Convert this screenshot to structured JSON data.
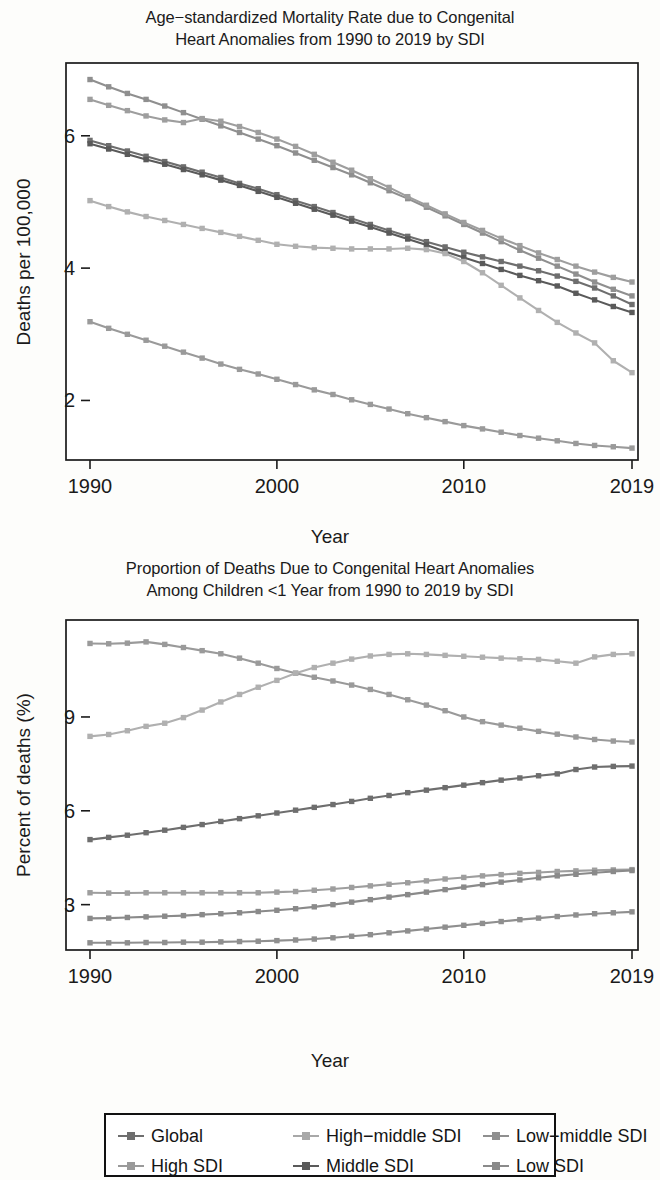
{
  "figure": {
    "xlabel": "Year",
    "x_ticks": [
      "1990",
      "2000",
      "2010",
      "2019"
    ]
  },
  "panel_top": {
    "title_line1": "Age−standardized Mortality Rate due to Congenital",
    "title_line2": "Heart Anomalies from 1990 to 2019 by SDI",
    "ylabel": "Deaths per 100,000",
    "y_ticks": [
      "2",
      "4",
      "6"
    ],
    "xlabel": "Year"
  },
  "panel_bottom": {
    "title_line1": "Proportion of Deaths Due to Congenital Heart Anomalies",
    "title_line2": "Among Children <1 Year from 1990 to 2019 by SDI",
    "ylabel": "Percent of deaths (%)",
    "y_ticks": [
      "3",
      "6",
      "9"
    ],
    "xlabel": "Year"
  },
  "legend": {
    "items": [
      {
        "label": "Global",
        "color": "#6e6e6e"
      },
      {
        "label": "High−middle SDI",
        "color": "#a8a8a8"
      },
      {
        "label": "Low−middle SDI",
        "color": "#8f8f8f"
      },
      {
        "label": "High SDI",
        "color": "#9a9a9a"
      },
      {
        "label": "Middle SDI",
        "color": "#5a5a5a"
      },
      {
        "label": "Low SDI",
        "color": "#8a8a8a"
      }
    ]
  },
  "chart_data": [
    {
      "type": "line",
      "title": "Age−standardized Mortality Rate due to Congenital Heart Anomalies from 1990 to 2019 by SDI",
      "xlabel": "Year",
      "ylabel": "Deaths per 100,000",
      "xlim": [
        1990,
        2019
      ],
      "ylim": [
        1.1,
        7.1
      ],
      "yticks": [
        2,
        4,
        6
      ],
      "xticks": [
        1990,
        2000,
        2010,
        2019
      ],
      "grid": false,
      "legend_position": "bottom-shared",
      "x": [
        1990,
        1991,
        1992,
        1993,
        1994,
        1995,
        1996,
        1997,
        1998,
        1999,
        2000,
        2001,
        2002,
        2003,
        2004,
        2005,
        2006,
        2007,
        2008,
        2009,
        2010,
        2011,
        2012,
        2013,
        2014,
        2015,
        2016,
        2017,
        2018,
        2019
      ],
      "series": [
        {
          "name": "Low SDI",
          "color": "#8f8f8f",
          "values": [
            6.85,
            6.74,
            6.64,
            6.55,
            6.45,
            6.35,
            6.25,
            6.15,
            6.05,
            5.95,
            5.85,
            5.74,
            5.63,
            5.52,
            5.41,
            5.29,
            5.17,
            5.05,
            4.92,
            4.79,
            4.66,
            4.53,
            4.4,
            4.27,
            4.15,
            4.03,
            3.91,
            3.79,
            3.68,
            3.58
          ],
          "endpoint_label": "3.58"
        },
        {
          "name": "Low−middle SDI",
          "color": "#9e9e9e",
          "values": [
            6.55,
            6.46,
            6.38,
            6.3,
            6.24,
            6.2,
            6.26,
            6.22,
            6.14,
            6.05,
            5.95,
            5.84,
            5.72,
            5.6,
            5.48,
            5.35,
            5.22,
            5.08,
            4.95,
            4.82,
            4.69,
            4.57,
            4.45,
            4.34,
            4.23,
            4.13,
            4.03,
            3.94,
            3.86,
            3.79
          ],
          "endpoint_label": "3.79"
        },
        {
          "name": "Global",
          "color": "#6e6e6e",
          "values": [
            5.93,
            5.85,
            5.77,
            5.69,
            5.61,
            5.53,
            5.45,
            5.37,
            5.28,
            5.2,
            5.11,
            5.02,
            4.93,
            4.84,
            4.75,
            4.66,
            4.57,
            4.48,
            4.4,
            4.32,
            4.24,
            4.17,
            4.1,
            4.03,
            3.96,
            3.88,
            3.8,
            3.7,
            3.58,
            3.45
          ],
          "endpoint_label": "3.45"
        },
        {
          "name": "Middle SDI",
          "color": "#5a5a5a",
          "values": [
            5.88,
            5.8,
            5.72,
            5.64,
            5.57,
            5.49,
            5.41,
            5.33,
            5.25,
            5.16,
            5.07,
            4.98,
            4.89,
            4.8,
            4.71,
            4.62,
            4.53,
            4.44,
            4.35,
            4.25,
            4.16,
            4.07,
            3.98,
            3.89,
            3.81,
            3.73,
            3.62,
            3.52,
            3.42,
            3.33
          ],
          "endpoint_label": "3.33"
        },
        {
          "name": "High−middle SDI",
          "color": "#b0b0b0",
          "values": [
            5.02,
            4.93,
            4.85,
            4.78,
            4.72,
            4.66,
            4.6,
            4.54,
            4.48,
            4.42,
            4.36,
            4.33,
            4.31,
            4.3,
            4.29,
            4.29,
            4.29,
            4.3,
            4.28,
            4.22,
            4.1,
            3.93,
            3.74,
            3.55,
            3.36,
            3.18,
            3.02,
            2.87,
            2.6,
            2.42
          ],
          "endpoint_label": "2.42"
        },
        {
          "name": "High SDI",
          "color": "#9a9a9a",
          "values": [
            3.19,
            3.09,
            3.0,
            2.91,
            2.82,
            2.73,
            2.64,
            2.55,
            2.47,
            2.4,
            2.32,
            2.24,
            2.16,
            2.09,
            2.01,
            1.94,
            1.87,
            1.8,
            1.74,
            1.68,
            1.62,
            1.57,
            1.52,
            1.47,
            1.43,
            1.39,
            1.35,
            1.32,
            1.3,
            1.28
          ],
          "endpoint_label": "1.28"
        }
      ]
    },
    {
      "type": "line",
      "title": "Proportion of Deaths Due to Congenital Heart Anomalies Among Children <1 Year from 1990 to 2019 by SDI",
      "xlabel": "Year",
      "ylabel": "Percent of deaths (%)",
      "xlim": [
        1990,
        2019
      ],
      "ylim": [
        1.55,
        12.1
      ],
      "yticks": [
        3,
        6,
        9
      ],
      "xticks": [
        1990,
        2000,
        2010,
        2019
      ],
      "grid": false,
      "legend_position": "bottom-shared",
      "x": [
        1990,
        1991,
        1992,
        1993,
        1994,
        1995,
        1996,
        1997,
        1998,
        1999,
        2000,
        2001,
        2002,
        2003,
        2004,
        2005,
        2006,
        2007,
        2008,
        2009,
        2010,
        2011,
        2012,
        2013,
        2014,
        2015,
        2016,
        2017,
        2018,
        2019
      ],
      "series": [
        {
          "name": "High SDI",
          "color": "#9a9a9a",
          "values": [
            11.35,
            11.34,
            11.36,
            11.4,
            11.32,
            11.22,
            11.12,
            11.02,
            10.88,
            10.72,
            10.55,
            10.4,
            10.27,
            10.15,
            10.02,
            9.88,
            9.72,
            9.55,
            9.38,
            9.2,
            9.0,
            8.85,
            8.74,
            8.64,
            8.54,
            8.45,
            8.36,
            8.28,
            8.23,
            8.2
          ],
          "endpoint_label": "8.20"
        },
        {
          "name": "High−middle SDI",
          "color": "#b0b0b0",
          "values": [
            8.38,
            8.44,
            8.56,
            8.7,
            8.8,
            8.98,
            9.22,
            9.48,
            9.72,
            9.95,
            10.17,
            10.4,
            10.58,
            10.72,
            10.85,
            10.95,
            11.0,
            11.02,
            11.0,
            10.97,
            10.94,
            10.91,
            10.88,
            10.86,
            10.84,
            10.78,
            10.72,
            10.92,
            11.0,
            11.02
          ],
          "endpoint_label": "11.02"
        },
        {
          "name": "Global",
          "color": "#6e6e6e",
          "values": [
            5.08,
            5.15,
            5.22,
            5.3,
            5.38,
            5.47,
            5.56,
            5.66,
            5.75,
            5.84,
            5.93,
            6.02,
            6.11,
            6.2,
            6.3,
            6.4,
            6.49,
            6.58,
            6.66,
            6.74,
            6.82,
            6.9,
            6.98,
            7.05,
            7.12,
            7.18,
            7.32,
            7.4,
            7.42,
            7.43
          ],
          "endpoint_label": "7.43"
        },
        {
          "name": "Low−middle SDI",
          "color": "#9e9e9e",
          "values": [
            3.38,
            3.37,
            3.37,
            3.38,
            3.38,
            3.38,
            3.38,
            3.38,
            3.38,
            3.38,
            3.4,
            3.42,
            3.46,
            3.5,
            3.55,
            3.6,
            3.65,
            3.7,
            3.76,
            3.82,
            3.87,
            3.92,
            3.96,
            4.0,
            4.03,
            4.06,
            4.08,
            4.1,
            4.11,
            4.12
          ],
          "endpoint_label": "4.12"
        },
        {
          "name": "Middle SDI",
          "color": "#8a8a8a",
          "values": [
            2.56,
            2.57,
            2.59,
            2.61,
            2.63,
            2.65,
            2.68,
            2.71,
            2.74,
            2.78,
            2.82,
            2.87,
            2.93,
            3.0,
            3.08,
            3.16,
            3.24,
            3.32,
            3.4,
            3.48,
            3.56,
            3.64,
            3.72,
            3.79,
            3.86,
            3.92,
            3.97,
            4.02,
            4.06,
            4.09
          ],
          "endpoint_label": "4.09"
        },
        {
          "name": "Low SDI",
          "color": "#8f8f8f",
          "values": [
            1.78,
            1.78,
            1.78,
            1.79,
            1.79,
            1.8,
            1.8,
            1.81,
            1.82,
            1.83,
            1.85,
            1.87,
            1.9,
            1.94,
            1.99,
            2.04,
            2.1,
            2.16,
            2.22,
            2.28,
            2.34,
            2.4,
            2.46,
            2.52,
            2.57,
            2.62,
            2.67,
            2.71,
            2.74,
            2.77
          ],
          "endpoint_label": "2.77"
        }
      ]
    }
  ]
}
